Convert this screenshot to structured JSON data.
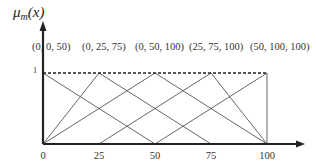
{
  "chart_data": {
    "type": "line",
    "title": "",
    "ylabel": "μm(x)",
    "ylabel_main": "μ",
    "ylabel_sub": "m",
    "ylabel_arg": "(x)",
    "xlabel": "",
    "xlim": [
      0,
      100
    ],
    "ylim": [
      0,
      1
    ],
    "x_ticks": [
      "0",
      "25",
      "50",
      "75",
      "100"
    ],
    "y_ticks": [
      "1"
    ],
    "grid": false,
    "legend": "labels above plot",
    "reference_line": {
      "y": 1,
      "style": "dashed"
    },
    "series": [
      {
        "name": "(0, 0, 50)",
        "x": [
          0,
          0,
          50
        ],
        "y": [
          0,
          1,
          0
        ]
      },
      {
        "name": "(0, 25, 75)",
        "x": [
          0,
          25,
          75
        ],
        "y": [
          0,
          1,
          0
        ]
      },
      {
        "name": "(0, 50, 100)",
        "x": [
          0,
          50,
          100
        ],
        "y": [
          0,
          1,
          0
        ]
      },
      {
        "name": "(25, 75, 100)",
        "x": [
          25,
          75,
          100
        ],
        "y": [
          0,
          1,
          0
        ]
      },
      {
        "name": "(50, 100, 100)",
        "x": [
          50,
          100,
          100
        ],
        "y": [
          0,
          1,
          0
        ]
      }
    ]
  },
  "labels": {
    "tri": [
      "(0, 0, 50)",
      "(0, 25, 75)",
      "(0, 50, 100)",
      "(25, 75, 100)",
      "(50, 100, 100)"
    ],
    "xticks": [
      "0",
      "25",
      "50",
      "75",
      "100"
    ],
    "one": "1"
  }
}
